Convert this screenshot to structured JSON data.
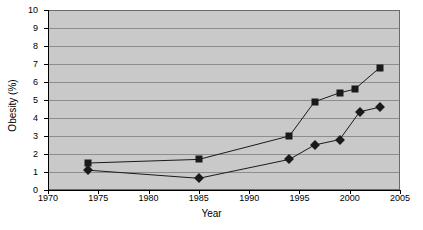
{
  "chart_data": {
    "type": "line",
    "title": "",
    "xlabel": "Year",
    "ylabel": "Obesity (%)",
    "xlim": [
      1970,
      2005
    ],
    "ylim": [
      0,
      10
    ],
    "xticks": [
      1970,
      1975,
      1980,
      1985,
      1990,
      1995,
      2000,
      2005
    ],
    "yticks": [
      0,
      1,
      2,
      3,
      4,
      5,
      6,
      7,
      8,
      9,
      10
    ],
    "grid": "horizontal",
    "legend": "none",
    "plot_background": "#c9c9c9",
    "series_color": "#1a1a1a",
    "series": [
      {
        "name": "square-series",
        "marker": "square",
        "x": [
          1974,
          1985,
          1994,
          1996.5,
          1999,
          2000.5,
          2003
        ],
        "values": [
          1.5,
          1.7,
          3.0,
          4.9,
          5.4,
          5.6,
          6.8
        ]
      },
      {
        "name": "diamond-series",
        "marker": "diamond",
        "x": [
          1974,
          1985,
          1994,
          1996.5,
          1999,
          2001,
          2003
        ],
        "values": [
          1.1,
          0.65,
          1.7,
          2.5,
          2.8,
          4.35,
          4.6
        ]
      }
    ]
  }
}
